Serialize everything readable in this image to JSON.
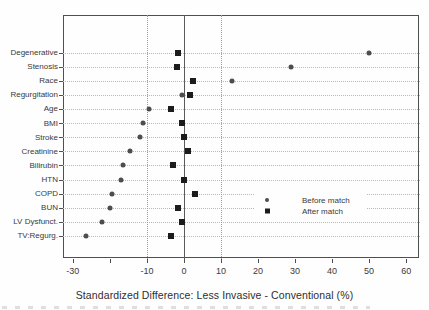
{
  "figure": {
    "kind": "matched-cohort standardized difference dot plot",
    "colors": {
      "before_marker": "#4d4d4d",
      "after_marker": "#1c1c1c",
      "frame": "#4f4f4f",
      "grid_dotted": "#b9b9b9",
      "zero_line": "#5a5a5a",
      "background": "#fefefe"
    }
  },
  "chart_data": {
    "type": "scatter",
    "subtype": "horizontal-dot-plot",
    "title": "",
    "xlabel": "Standardized Difference: Less Invasive - Conventional (%)",
    "ylabel": "",
    "xlim": [
      -32.8,
      63.6
    ],
    "grid": {
      "horizontal": "dotted line per category",
      "vertical_dotted_at": [
        -10,
        10
      ],
      "zero_reference_line": true
    },
    "categories": [
      "Degenerative",
      "Stenosis",
      "Race",
      "Regurgitation",
      "Age",
      "BMI",
      "Stroke",
      "Creatinine",
      "Bilirubin",
      "HTN",
      "COPD",
      "BUN",
      "LV Dysfunct.",
      "TV:Regurg."
    ],
    "series": [
      {
        "name": "Before match",
        "marker": "circle",
        "color": "#4d4d4d",
        "values": [
          50,
          29,
          13,
          -0.5,
          -9.5,
          -11,
          -12,
          -14.5,
          -16.5,
          -17,
          -19.5,
          -20,
          -22,
          -26.5
        ]
      },
      {
        "name": "After match",
        "marker": "square",
        "color": "#1c1c1c",
        "values": [
          -1.5,
          -2,
          2.5,
          1.5,
          -3.5,
          -0.5,
          0,
          1,
          -3,
          0,
          3,
          -1.5,
          -0.5,
          -3.5
        ]
      }
    ],
    "xticks": [
      {
        "v": -30,
        "label": "-30"
      },
      {
        "v": -20,
        "label": ""
      },
      {
        "v": -10,
        "label": "-10"
      },
      {
        "v": 0,
        "label": "0"
      },
      {
        "v": 10,
        "label": "10"
      },
      {
        "v": 20,
        "label": "20"
      },
      {
        "v": 30,
        "label": "30"
      },
      {
        "v": 40,
        "label": "40"
      },
      {
        "v": 50,
        "label": "50"
      },
      {
        "v": 60,
        "label": "60"
      }
    ],
    "legend": {
      "position": "inside right, no border, white background",
      "items": [
        "Before match",
        "After match"
      ]
    }
  }
}
